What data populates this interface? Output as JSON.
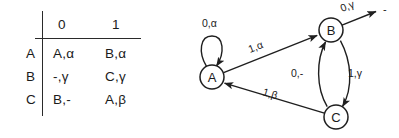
{
  "figure": {
    "ink_color": "#1f1f1f",
    "background_color": "#ffffff"
  },
  "table": {
    "corner_label": "",
    "column_headers": [
      "0",
      "1"
    ],
    "row_headers": [
      "A",
      "B",
      "C"
    ],
    "rows": [
      {
        "state": "A",
        "on_0": "A,α",
        "on_1": "B,α"
      },
      {
        "state": "B",
        "on_0": "-,γ",
        "on_1": "C,γ"
      },
      {
        "state": "C",
        "on_0": "B,-",
        "on_1": "A,β"
      }
    ]
  },
  "diagram": {
    "nodes": [
      {
        "id": "A",
        "label": "A",
        "cx": 22,
        "cy": 77,
        "r": 12
      },
      {
        "id": "B",
        "label": "B",
        "cx": 141,
        "cy": 30,
        "r": 12
      },
      {
        "id": "C",
        "label": "C",
        "cx": 146,
        "cy": 117,
        "r": 12
      }
    ],
    "sink": {
      "label": "-",
      "x": 196,
      "y": 12
    },
    "edges": [
      {
        "id": "A-self",
        "from": "A",
        "to": "A",
        "label": "0,α",
        "lx": 12,
        "ly": 24
      },
      {
        "id": "A-to-B",
        "from": "A",
        "to": "B",
        "label": "1,α",
        "lx": 65,
        "ly": 50
      },
      {
        "id": "B-to-sink",
        "from": "B",
        "to": "-",
        "label": "0,γ",
        "lx": 155,
        "ly": 13
      },
      {
        "id": "B-to-C",
        "from": "B",
        "to": "C",
        "label": "1,γ",
        "lx": 157,
        "ly": 74
      },
      {
        "id": "C-to-B",
        "from": "C",
        "to": "B",
        "label": "0,-",
        "lx": 103,
        "ly": 74
      },
      {
        "id": "C-to-A",
        "from": "C",
        "to": "A",
        "label": "1,β",
        "lx": 78,
        "ly": 93
      }
    ]
  }
}
